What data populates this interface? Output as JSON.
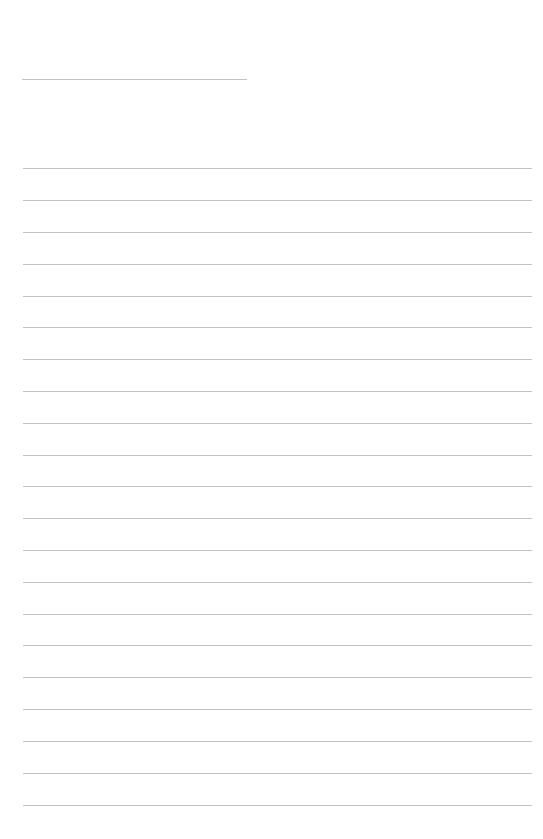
{
  "page": {
    "type": "blank lined sheet",
    "title_line": {
      "text": ""
    },
    "writing_lines": [
      {
        "text": ""
      },
      {
        "text": ""
      },
      {
        "text": ""
      },
      {
        "text": ""
      },
      {
        "text": ""
      },
      {
        "text": ""
      },
      {
        "text": ""
      },
      {
        "text": ""
      },
      {
        "text": ""
      },
      {
        "text": ""
      },
      {
        "text": ""
      },
      {
        "text": ""
      },
      {
        "text": ""
      },
      {
        "text": ""
      },
      {
        "text": ""
      },
      {
        "text": ""
      },
      {
        "text": ""
      },
      {
        "text": ""
      },
      {
        "text": ""
      },
      {
        "text": ""
      },
      {
        "text": ""
      }
    ],
    "line_color": "#b8b8b8",
    "background": "#ffffff"
  }
}
